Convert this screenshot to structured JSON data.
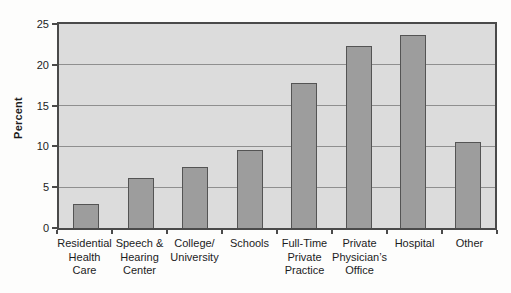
{
  "chart_data": {
    "type": "bar",
    "title": "",
    "xlabel": "",
    "ylabel": "Percent",
    "ylim": [
      0,
      25
    ],
    "yticks": [
      0,
      5,
      10,
      15,
      20,
      25
    ],
    "grid": true,
    "legend": false,
    "categories": [
      "Residential\nHealth\nCare",
      "Speech &\nHearing\nCenter",
      "College/\nUniversity",
      "Schools",
      "Full-Time\nPrivate\nPractice",
      "Private\nPhysician’s\nOffice",
      "Hospital",
      "Other"
    ],
    "values": [
      3.0,
      6.1,
      7.5,
      9.5,
      17.8,
      22.3,
      23.7,
      10.6
    ],
    "colors": {
      "plot_background": "#dcdcdc",
      "bar_fill": "#9d9d9d",
      "bar_border": "#545454",
      "gridline": "#8f8f8f",
      "axis": "#4a4a4a",
      "text": "#1c1c1c"
    }
  }
}
